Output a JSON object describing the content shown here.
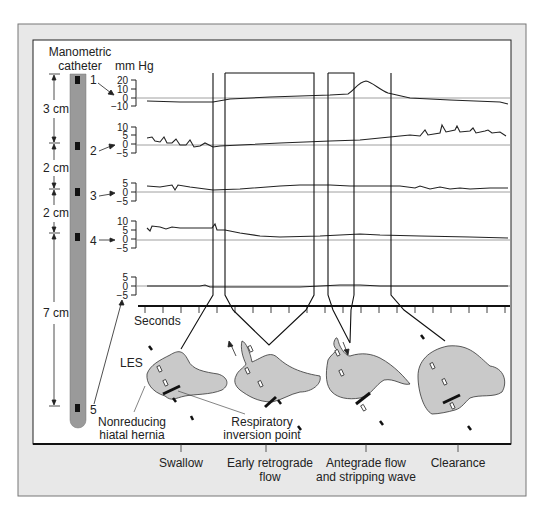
{
  "figure": {
    "catheter_title_line1": "Manometric",
    "catheter_title_line2": "catheter",
    "units": "mm Hg",
    "seconds_label": "Seconds",
    "colors": {
      "outer_frame": "#e8e8e8",
      "panel": "#ffffff",
      "catheter": "#9a9a9a",
      "sensor": "#111111",
      "stomach_fill": "#c9c9c9",
      "trace": "#222222",
      "baseline": "#888888"
    },
    "distances": [
      {
        "label": "3 cm"
      },
      {
        "label": "2 cm"
      },
      {
        "label": "2 cm"
      },
      {
        "label": "7 cm"
      }
    ],
    "sensors": [
      {
        "label": "1"
      },
      {
        "label": "2"
      },
      {
        "label": "3"
      },
      {
        "label": "4"
      },
      {
        "label": "5"
      }
    ],
    "channels": [
      {
        "ticks": [
          "20",
          "10",
          "0",
          "−10"
        ]
      },
      {
        "ticks": [
          "10",
          "5",
          "0",
          "−5"
        ]
      },
      {
        "ticks": [
          "5",
          "0",
          "−5"
        ]
      },
      {
        "ticks": [
          "10",
          "5",
          "0",
          "−5"
        ]
      },
      {
        "ticks": [
          "5",
          "0",
          "−5"
        ]
      }
    ],
    "annotations": {
      "les": "LES",
      "hernia_line1": "Nonreducing",
      "hernia_line2": "hiatal hernia",
      "resp_line1": "Respiratory",
      "resp_line2": "inversion point"
    },
    "phases": [
      {
        "label_line1": "Swallow",
        "label_line2": ""
      },
      {
        "label_line1": "Early retrograde",
        "label_line2": "flow"
      },
      {
        "label_line1": "Antegrade flow",
        "label_line2": "and stripping wave"
      },
      {
        "label_line1": "Clearance",
        "label_line2": ""
      }
    ]
  }
}
